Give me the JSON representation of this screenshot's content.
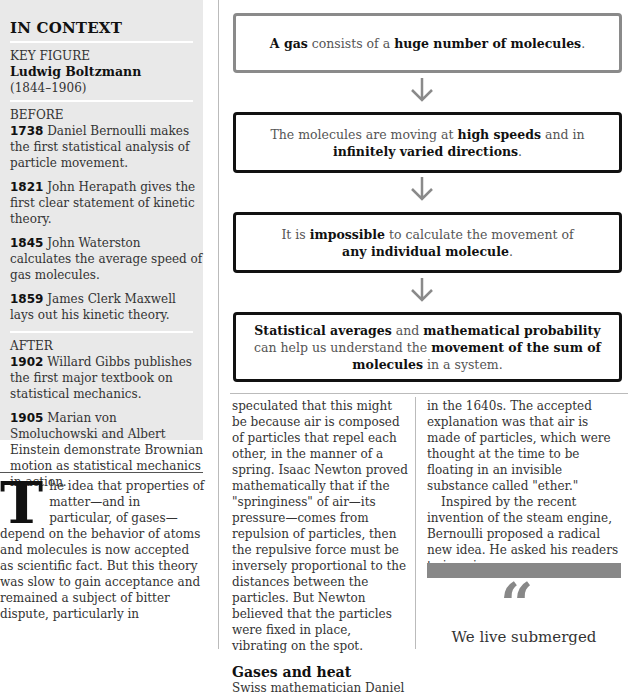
{
  "sidebar": {
    "title": "IN CONTEXT",
    "key_figure_label": "KEY FIGURE",
    "key_figure_name": "Ludwig Boltzmann",
    "key_figure_dates": "(1844–1906)",
    "before_label": "BEFORE",
    "before": [
      {
        "year": "1738",
        "text": " Daniel Bernoulli makes the first statistical analysis of particle movement."
      },
      {
        "year": "1821",
        "text": " John Herapath gives the first clear statement of kinetic theory."
      },
      {
        "year": "1845",
        "text": " John Waterston calculates the average speed of gas molecules."
      },
      {
        "year": "1859",
        "text": " James Clerk Maxwell lays out his kinetic theory."
      }
    ],
    "after_label": "AFTER",
    "after": [
      {
        "year": "1902",
        "text": " Willard Gibbs publishes the first major textbook on statistical mechanics."
      },
      {
        "year": "1905",
        "text": " Marian von Smoluchowski and Albert Einstein demonstrate Brownian motion as statistical mechanics in action."
      }
    ]
  },
  "flowchart": [
    {
      "parts": [
        {
          "b": "A gas"
        },
        {
          "t": " consists of a "
        },
        {
          "b": "huge number of molecules"
        },
        {
          "t": "."
        }
      ]
    },
    {
      "parts": [
        {
          "t": "The molecules are moving at "
        },
        {
          "b": "high speeds"
        },
        {
          "t": " and in "
        },
        {
          "br": true
        },
        {
          "b": "infinitely varied directions"
        },
        {
          "t": "."
        }
      ]
    },
    {
      "parts": [
        {
          "t": "It is "
        },
        {
          "b": "impossible"
        },
        {
          "t": " to calculate the movement of "
        },
        {
          "br": true
        },
        {
          "b": "any individual molecule"
        },
        {
          "t": "."
        }
      ]
    },
    {
      "parts": [
        {
          "b": "Statistical averages"
        },
        {
          "t": " and "
        },
        {
          "b": "mathematical probability"
        },
        {
          "br": true
        },
        {
          "t": "can help us understand the "
        },
        {
          "b": "movement of the sum of"
        },
        {
          "br": true
        },
        {
          "b": "molecules"
        },
        {
          "t": " in a system."
        }
      ]
    }
  ],
  "article": {
    "dropcap": "T",
    "col1_text": "he idea that properties of matter—and in particular, of gases—depend on the behavior of atoms and molecules is now accepted as scientific fact. But this theory was slow to gain acceptance and remained a subject of bitter dispute, particularly in",
    "col2_text": "speculated that this might be because air is composed of particles that repel each other, in the manner of a spring. Isaac Newton proved mathematically that if the \"springiness\" of air—its pressure—comes from repulsion of particles, then the repulsive force must be inversely proportional to the distances between the particles. But Newton believed that the particles were fixed in place, vibrating on the spot.",
    "subhead": "Gases and heat",
    "col2_after": "Swiss mathematician Daniel",
    "col3_p1": "in the 1640s. The accepted explanation was that air is made of particles, which were thought at the time to be floating in an invisible substance called \"ether.\"",
    "col3_p2": "Inspired by the recent invention of the steam engine, Bernoulli proposed a radical new idea. He asked his readers to imagine a",
    "quote_mark": "“",
    "quote_text": "We live submerged"
  }
}
